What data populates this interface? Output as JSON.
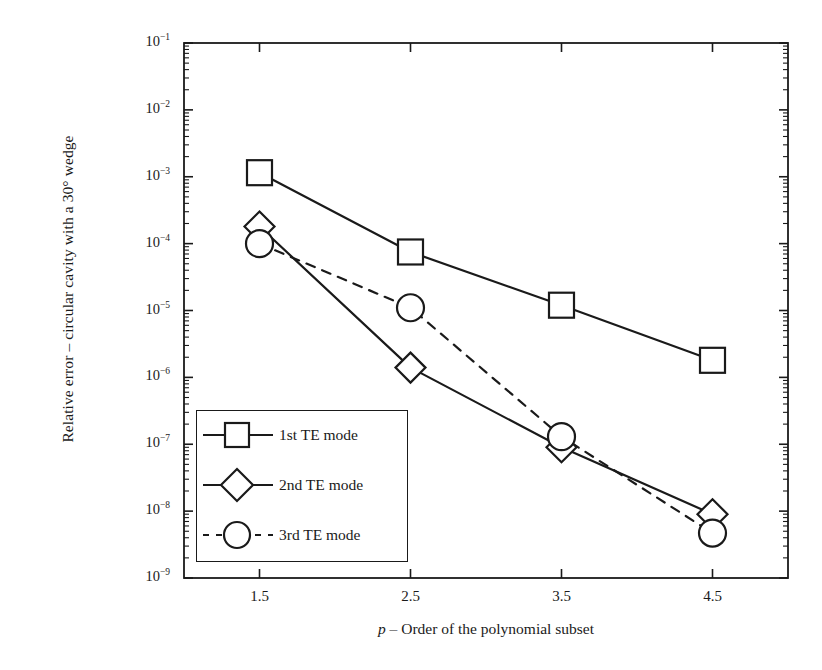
{
  "chart_data": {
    "type": "line",
    "title": "",
    "subtitle": "",
    "xlabel": "p – Order of the polynomial subset",
    "xlabel_italic_prefix": "p",
    "xlabel_rest": " – Order of the polynomial subset",
    "ylabel": "Relative error – circular cavity with a 30° wedge",
    "x": [
      1.5,
      2.5,
      3.5,
      4.5
    ],
    "xtick_labels": [
      "1.5",
      "2.5",
      "3.5",
      "4.5"
    ],
    "xlim": [
      1.0,
      5.0
    ],
    "ylim": [
      1e-09,
      0.1
    ],
    "yscale": "log",
    "ytick_values": [
      0.1,
      0.01,
      0.001,
      0.0001,
      1e-05,
      1e-06,
      1e-07,
      1e-08,
      1e-09
    ],
    "ytick_labels": [
      "10-1",
      "10-2",
      "10-3",
      "10-4",
      "10-5",
      "10-6",
      "10-7",
      "10-8",
      "10-9"
    ],
    "ytick_mantissa": "10",
    "ytick_exponents": [
      "−1",
      "−2",
      "−3",
      "−4",
      "−5",
      "−6",
      "−7",
      "−8",
      "−9"
    ],
    "grid": false,
    "legend_position": "lower-left-inside",
    "series": [
      {
        "name": "1st TE mode",
        "marker": "square",
        "linestyle": "solid",
        "color": "#1a1a1a",
        "values": [
          0.00115,
          7.5e-05,
          1.2e-05,
          1.8e-06
        ]
      },
      {
        "name": "2nd TE mode",
        "marker": "diamond",
        "linestyle": "solid",
        "color": "#1a1a1a",
        "values": [
          0.00018,
          1.4e-06,
          9e-08,
          9e-09
        ]
      },
      {
        "name": "3rd TE mode",
        "marker": "circle",
        "linestyle": "dashed",
        "color": "#1a1a1a",
        "values": [
          0.0001,
          1.1e-05,
          1.3e-07,
          4.7e-09
        ]
      }
    ]
  },
  "legend": {
    "entries": [
      {
        "label": "1st TE mode",
        "marker": "square",
        "linestyle": "solid"
      },
      {
        "label": "2nd TE mode",
        "marker": "diamond",
        "linestyle": "solid"
      },
      {
        "label": "3rd TE mode",
        "marker": "circle",
        "linestyle": "dashed"
      }
    ]
  },
  "colors": {
    "foreground": "#1a1a1a",
    "background": "#ffffff"
  }
}
